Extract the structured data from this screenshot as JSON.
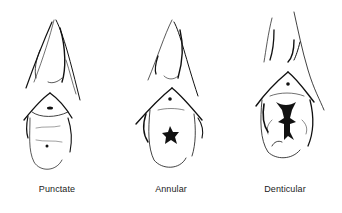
{
  "figure": {
    "panels": [
      {
        "label": "Punctate"
      },
      {
        "label": "Annular"
      },
      {
        "label": "Denticular"
      }
    ]
  },
  "colors": {
    "ink": "#111111",
    "background": "#ffffff"
  }
}
